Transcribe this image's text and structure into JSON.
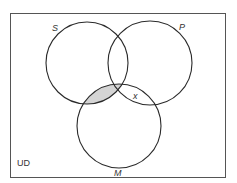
{
  "diagram": {
    "type": "venn-3",
    "universe_label": "UD",
    "colors": {
      "stroke": "#2a2a2a",
      "frame": "#555555",
      "shade": "#d4d4d4",
      "background": "#ffffff"
    },
    "circles": [
      {
        "id": "S",
        "label": "S",
        "cx": 87,
        "cy": 63,
        "r": 41,
        "label_x": 52,
        "label_y": 31
      },
      {
        "id": "P",
        "label": "P",
        "cx": 150,
        "cy": 63,
        "r": 42,
        "label_x": 179,
        "label_y": 30
      },
      {
        "id": "M",
        "label": "M",
        "cx": 119,
        "cy": 126,
        "r": 42,
        "label_x": 114,
        "label_y": 176
      }
    ],
    "shaded_regions": [
      "S∩M"
    ],
    "marks": [
      {
        "symbol": "x",
        "region": "P∩M outside S",
        "x": 133,
        "y": 99
      }
    ]
  }
}
